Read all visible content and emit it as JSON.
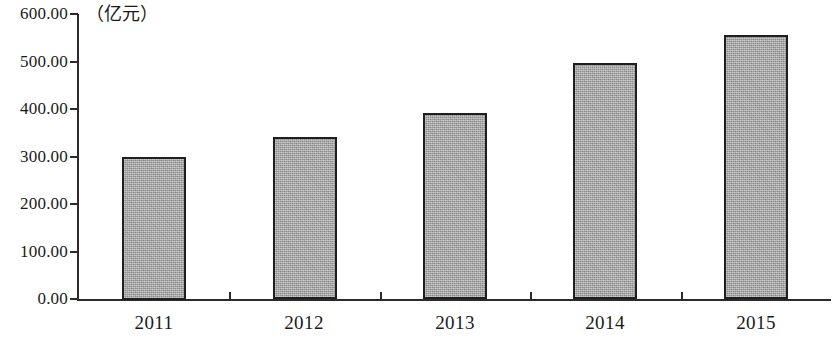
{
  "chart_data": {
    "type": "bar",
    "title": "",
    "subtitle": "",
    "unit_label": "（亿元）",
    "xlabel": "",
    "ylabel": "",
    "categories": [
      "2011",
      "2012",
      "2013",
      "2014",
      "2015"
    ],
    "values": [
      300.0,
      341.0,
      392.0,
      496.0,
      555.0
    ],
    "series": [
      {
        "name": "",
        "values": [
          300.0,
          341.0,
          392.0,
          496.0,
          555.0
        ]
      }
    ],
    "ylim": [
      0,
      600
    ],
    "ytick_values": [
      0,
      100,
      200,
      300,
      400,
      500,
      600
    ],
    "ytick_labels": [
      "0.00",
      "100.00",
      "200.00",
      "300.00",
      "400.00",
      "500.00",
      "600.00"
    ],
    "xtick_labels": [
      "2011",
      "2012",
      "2013",
      "2014",
      "2015"
    ],
    "grid": false,
    "legend": false,
    "legend_position": "none",
    "annotations": [],
    "colors": {
      "bar_fill": "#a9a9a9",
      "bar_border": "#1f1f1f",
      "axis": "#2b2b2b",
      "text": "#1a1a1a",
      "background": "#ffffff"
    }
  }
}
